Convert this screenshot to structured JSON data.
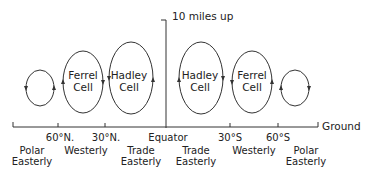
{
  "diagram": {
    "axis_label": "10 miles up",
    "ground_label": "Ground",
    "equator_label": "Equator",
    "latitudes": [
      {
        "label": "60°N.",
        "x": 58
      },
      {
        "label": "30°N.",
        "x": 105
      },
      {
        "label": "30°S",
        "x": 230
      },
      {
        "label": "60°S",
        "x": 278
      }
    ],
    "cells": [
      {
        "name": "",
        "hemisphere": "N",
        "type": "polar"
      },
      {
        "name": "Ferrel",
        "sub": "Cell",
        "hemisphere": "N"
      },
      {
        "name": "Hadley",
        "sub": "Cell",
        "hemisphere": "N"
      },
      {
        "name": "Hadley",
        "sub": "Cell",
        "hemisphere": "S"
      },
      {
        "name": "Ferrel",
        "sub": "Cell",
        "hemisphere": "S"
      },
      {
        "name": "",
        "hemisphere": "S",
        "type": "polar"
      }
    ],
    "winds": [
      {
        "line1": "Polar",
        "line2": "Easterly"
      },
      {
        "line1": "Westerly",
        "line2": ""
      },
      {
        "line1": "Trade",
        "line2": "Easterly"
      },
      {
        "line1": "Trade",
        "line2": "Easterly"
      },
      {
        "line1": "Westerly",
        "line2": ""
      },
      {
        "line1": "Polar",
        "line2": "Easterly"
      }
    ],
    "stroke_color": "#333333"
  }
}
